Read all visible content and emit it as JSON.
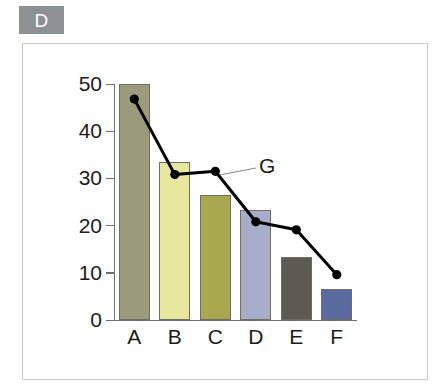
{
  "badge": {
    "label": "D"
  },
  "chart_data": {
    "type": "bar",
    "title": "",
    "subtitle": "",
    "xlabel": "",
    "ylabel": "",
    "categories": [
      "A",
      "B",
      "C",
      "D",
      "E",
      "F"
    ],
    "values": [
      50.0,
      33.5,
      26.5,
      23.2,
      13.4,
      6.6
    ],
    "bar_colors": [
      "#9a9a7c",
      "#e8e79f",
      "#a9a84f",
      "#a8aec9",
      "#5b5b53",
      "#5b6a9e"
    ],
    "bar_border_color": "#6e6e62",
    "series": [
      {
        "name": "G",
        "type": "line",
        "values": [
          46.8,
          30.8,
          31.5,
          20.8,
          19.1,
          9.6
        ],
        "color": "#000000",
        "marker": "circle",
        "annotation": "G"
      }
    ],
    "yticks": [
      0,
      10,
      20,
      30,
      40,
      50
    ],
    "ylim": [
      0,
      52
    ],
    "grid": false,
    "legend": "none",
    "annotations": [
      {
        "text": "G",
        "target_point_index": 2
      }
    ],
    "axis_color": "#6f6f6f",
    "frame_color": "#c9c9c9",
    "badge_color": "#8d9195"
  }
}
